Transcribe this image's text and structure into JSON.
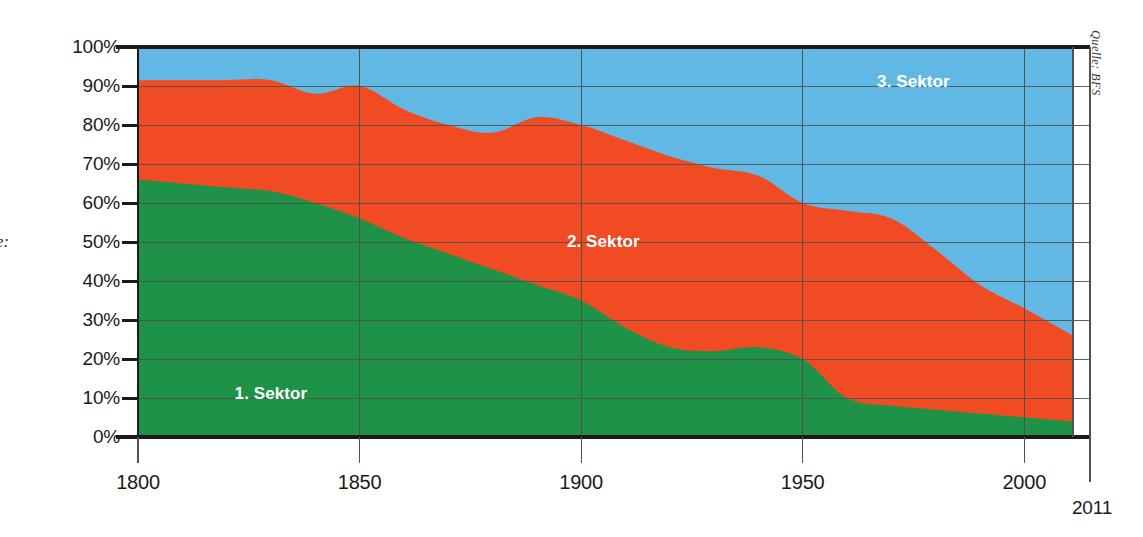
{
  "figure": {
    "left_caption_clipped": "ge:",
    "source_note": "Quelle: BFS"
  },
  "chart_data": {
    "type": "area",
    "stacked": true,
    "percent": true,
    "title": "",
    "subtitle": "",
    "xlabel": "",
    "ylabel": "",
    "xlim": [
      1800,
      2011
    ],
    "ylim": [
      0,
      100
    ],
    "grid": true,
    "legend": "in-plot",
    "x_ticks": [
      1800,
      1850,
      1900,
      1950,
      2000
    ],
    "x_tick_labels": [
      "1800",
      "1850",
      "1900",
      "1950",
      "2000"
    ],
    "x_end_tick": 2011,
    "x_end_label": "2011",
    "y_ticks": [
      0,
      10,
      20,
      30,
      40,
      50,
      60,
      70,
      80,
      90,
      100
    ],
    "y_tick_labels": [
      "0%",
      "10%",
      "20%",
      "30%",
      "40%",
      "50%",
      "60%",
      "70%",
      "80%",
      "90%",
      "100%"
    ],
    "colors": {
      "sektor1": "#1E9246",
      "sektor2": "#F04B22",
      "sektor3": "#61B8E4",
      "axis": "#1a1a1a",
      "grid": "#55504e"
    },
    "x": [
      1800,
      1810,
      1820,
      1830,
      1840,
      1850,
      1860,
      1870,
      1880,
      1890,
      1900,
      1910,
      1920,
      1930,
      1940,
      1950,
      1960,
      1970,
      1980,
      1990,
      2000,
      2011
    ],
    "series": [
      {
        "name": "1. Sektor",
        "color": "#1E9246",
        "label": "1. Sektor",
        "values": [
          66,
          65,
          64,
          63,
          60,
          56,
          51,
          47,
          43,
          39,
          35,
          28,
          23,
          22,
          23,
          20,
          10,
          8,
          7,
          6,
          5,
          4
        ]
      },
      {
        "name": "2. Sektor",
        "color": "#F04B22",
        "label": "2. Sektor",
        "values": [
          25.5,
          26.5,
          27.5,
          28.5,
          28,
          34,
          33,
          33,
          35,
          43,
          45,
          48,
          49,
          47,
          44,
          40,
          48,
          48,
          41,
          33,
          28,
          22
        ]
      },
      {
        "name": "3. Sektor",
        "color": "#61B8E4",
        "label": "3. Sektor",
        "values": [
          8.5,
          8.5,
          8.5,
          8.5,
          12,
          10,
          16,
          20,
          22,
          18,
          20,
          24,
          28,
          31,
          33,
          40,
          42,
          44,
          52,
          61,
          67,
          74
        ]
      }
    ],
    "cumulative_upper_bounds": {
      "sektor1_top": [
        66,
        65,
        64,
        63,
        60,
        56,
        51,
        47,
        43,
        39,
        35,
        28,
        23,
        22,
        23,
        20,
        10,
        8,
        7,
        6,
        5,
        4
      ],
      "sektor2_top": [
        91.5,
        91.5,
        91.5,
        91.5,
        88,
        90,
        84,
        80,
        78,
        82,
        80,
        76,
        72,
        69,
        67,
        60,
        58,
        56,
        48,
        39,
        33,
        26
      ]
    },
    "annotations": [
      {
        "text": "1. Sektor",
        "x": 1830,
        "y": 11
      },
      {
        "text": "2. Sektor",
        "x": 1905,
        "y": 50
      },
      {
        "text": "3. Sektor",
        "x": 1975,
        "y": 91
      }
    ]
  }
}
